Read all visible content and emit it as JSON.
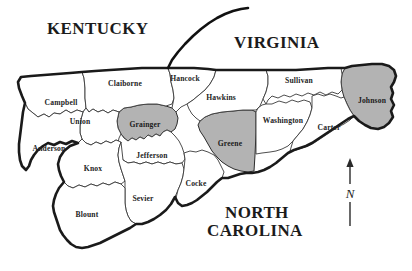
{
  "map": {
    "title": "East Tennessee counties map",
    "colors": {
      "background": "#ffffff",
      "county_fill": "#ffffff",
      "highlight_fill": "#b3b3b3",
      "county_stroke": "#3a3a3a",
      "region_outline": "#1a1a1a",
      "text": "#1b1b1b"
    },
    "state_labels": [
      {
        "name": "kentucky",
        "text": "KENTUCKY",
        "x": 47,
        "y": 20
      },
      {
        "name": "virginia",
        "text": "VIRGINIA",
        "x": 234,
        "y": 34
      },
      {
        "name": "north-carolina-line1",
        "text": "NORTH",
        "x": 225,
        "y": 204
      },
      {
        "name": "north-carolina-line2",
        "text": "CAROLINA",
        "x": 207,
        "y": 222
      }
    ],
    "counties": [
      {
        "name": "campbell",
        "label": "Campbell",
        "x": 61,
        "y": 102,
        "highlighted": false
      },
      {
        "name": "claiborne",
        "label": "Claiborne",
        "x": 125,
        "y": 83,
        "highlighted": false
      },
      {
        "name": "hancock",
        "label": "Hancock",
        "x": 185,
        "y": 78,
        "highlighted": false
      },
      {
        "name": "hawkins",
        "label": "Hawkins",
        "x": 221,
        "y": 97,
        "highlighted": false
      },
      {
        "name": "sullivan",
        "label": "Sullivan",
        "x": 299,
        "y": 80,
        "highlighted": false
      },
      {
        "name": "johnson",
        "label": "Johnson",
        "x": 372,
        "y": 100,
        "highlighted": true
      },
      {
        "name": "union",
        "label": "Union",
        "x": 80,
        "y": 121,
        "highlighted": false
      },
      {
        "name": "grainger",
        "label": "Grainger",
        "x": 145,
        "y": 124,
        "highlighted": true
      },
      {
        "name": "greene",
        "label": "Greene",
        "x": 230,
        "y": 143,
        "highlighted": true
      },
      {
        "name": "washington",
        "label": "Washington",
        "x": 283,
        "y": 120,
        "highlighted": false
      },
      {
        "name": "carter",
        "label": "Carter",
        "x": 329,
        "y": 127,
        "highlighted": false
      },
      {
        "name": "anderson",
        "label": "Anderson",
        "x": 49,
        "y": 148,
        "highlighted": false
      },
      {
        "name": "jefferson",
        "label": "Jefferson",
        "x": 152,
        "y": 155,
        "highlighted": false
      },
      {
        "name": "knox",
        "label": "Knox",
        "x": 93,
        "y": 168,
        "highlighted": false
      },
      {
        "name": "sevier",
        "label": "Sevier",
        "x": 143,
        "y": 198,
        "highlighted": false
      },
      {
        "name": "cocke",
        "label": "Cocke",
        "x": 196,
        "y": 183,
        "highlighted": false
      },
      {
        "name": "blount",
        "label": "Blount",
        "x": 87,
        "y": 214,
        "highlighted": false
      }
    ],
    "compass": {
      "letter": "N",
      "name": "north-arrow"
    }
  }
}
